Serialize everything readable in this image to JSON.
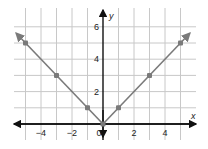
{
  "chart_data": {
    "type": "line",
    "title": "",
    "xlabel": "x",
    "ylabel": "y",
    "xlim": [
      -5.5,
      6
    ],
    "ylim": [
      -0.5,
      6.5
    ],
    "grid": true,
    "x_ticks": [
      -4,
      -2,
      0,
      2,
      4
    ],
    "x_tick_labels": [
      "−4",
      "−2",
      "0",
      "2",
      "4"
    ],
    "y_ticks": [
      2,
      4,
      6
    ],
    "y_tick_labels": [
      "2",
      "4",
      "6"
    ],
    "series": [
      {
        "name": "y = |x|",
        "x": [
          -5,
          -3,
          -1,
          0,
          1,
          3,
          5
        ],
        "y": [
          5,
          3,
          1,
          0,
          1,
          3,
          5
        ],
        "markers": true,
        "arrows_at_ends": true
      }
    ],
    "colors": {
      "line": "#7a7a7a",
      "marker": "#7a7a7a",
      "grid": "#c8c8c8",
      "axis": "#111111"
    }
  }
}
